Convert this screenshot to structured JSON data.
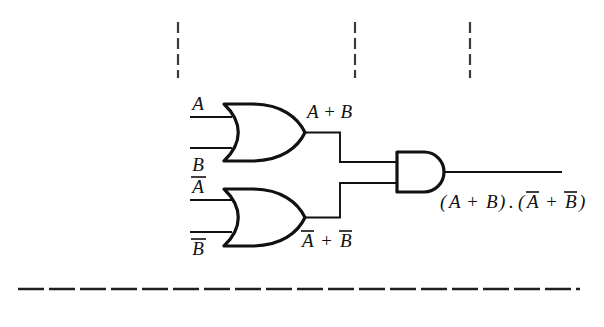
{
  "diagram": {
    "background_color": "#ffffff",
    "ink_color": "#111111",
    "inputs": [
      {
        "id": "in-a",
        "label": "A",
        "overbar": false,
        "wire_y": 117
      },
      {
        "id": "in-b",
        "label": "B",
        "overbar": false,
        "wire_y": 148
      },
      {
        "id": "in-a-bar",
        "label": "A",
        "overbar": true,
        "wire_y": 200
      },
      {
        "id": "in-b-bar",
        "label": "B",
        "overbar": true,
        "wire_y": 232
      }
    ],
    "gates": [
      {
        "id": "or-gate-top",
        "type": "OR",
        "output_label_plain": "A + B"
      },
      {
        "id": "or-gate-bottom",
        "type": "OR",
        "output_label_plain": "A-bar + B-bar"
      },
      {
        "id": "and-gate",
        "type": "AND",
        "output_label_plain": "(A + B).(A-bar + B-bar)"
      }
    ],
    "wire_labels": {
      "top_or_output": "A + B",
      "bottom_or_output_terms": [
        "A",
        "B"
      ],
      "bottom_or_output_operator": "+"
    },
    "output_expression": {
      "open_paren": "(",
      "a": "A",
      "plus1": "+",
      "b": "B",
      "close_paren": ")",
      "dot": ".",
      "open_paren2": "(",
      "a_bar": "A",
      "plus2": "+",
      "b_bar": "B",
      "close_paren2": ")"
    },
    "annotations": {
      "dashed_vertical_marks": [
        {
          "id": "mark-1",
          "x": 178,
          "y_top": 22,
          "y_bottom": 78
        },
        {
          "id": "mark-2",
          "x": 355,
          "y_top": 22,
          "y_bottom": 78
        },
        {
          "id": "mark-3",
          "x": 470,
          "y_top": 22,
          "y_bottom": 78
        }
      ],
      "dashed_rule": {
        "id": "bottom-rule",
        "x_start": 18,
        "x_end": 580,
        "y": 289
      }
    }
  }
}
